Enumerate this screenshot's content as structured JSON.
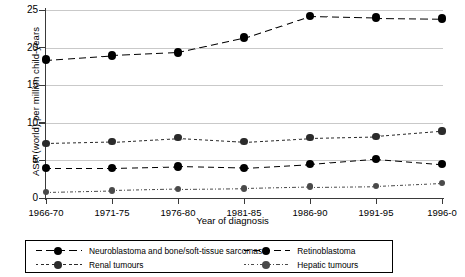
{
  "chart_data": {
    "type": "line",
    "title": "",
    "xlabel": "Year of diagnosis",
    "ylabel": "ASR (world) per million child-years",
    "categories": [
      "1966-70",
      "1971-75",
      "1976-80",
      "1981-85",
      "1986-90",
      "1991-95",
      "1996-0"
    ],
    "ylim": [
      0,
      25
    ],
    "yticks": [
      0,
      5,
      10,
      15,
      20,
      25
    ],
    "grid": true,
    "legend_position": "bottom",
    "series": [
      {
        "name": "Neuroblastoma and bone/soft-tissue sarcomas",
        "values": [
          18.4,
          19.0,
          19.4,
          21.3,
          24.2,
          24.0,
          23.9
        ],
        "color": "#000000",
        "dash": "long-dash",
        "marker": "circle"
      },
      {
        "name": "Renal tumours",
        "values": [
          7.3,
          7.5,
          8.0,
          7.5,
          8.0,
          8.2,
          8.9
        ],
        "color": "#2b2b2b",
        "dash": "short-dash",
        "marker": "circle"
      },
      {
        "name": "Retinoblastoma",
        "values": [
          4.0,
          4.0,
          4.2,
          4.0,
          4.5,
          5.2,
          4.5
        ],
        "color": "#000000",
        "dash": "medium-dash",
        "marker": "circle"
      },
      {
        "name": "Hepatic tumours",
        "values": [
          0.8,
          1.0,
          1.2,
          1.3,
          1.5,
          1.6,
          2.0
        ],
        "color": "#4a4a4a",
        "dash": "dash-dot",
        "marker": "circle"
      }
    ]
  }
}
